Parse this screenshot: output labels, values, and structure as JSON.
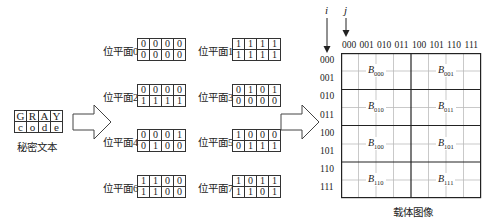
{
  "secret": {
    "rows": [
      [
        "G",
        "R",
        "A",
        "Y"
      ],
      [
        "c",
        "o",
        "d",
        "e"
      ]
    ],
    "caption": "秘密文本"
  },
  "bit_planes": [
    {
      "label": "位平面0",
      "rows": [
        [
          "0",
          "0",
          "0",
          "0"
        ],
        [
          "0",
          "0",
          "0",
          "0"
        ]
      ]
    },
    {
      "label": "位平面1",
      "rows": [
        [
          "1",
          "1",
          "1",
          "1"
        ],
        [
          "1",
          "1",
          "1",
          "1"
        ]
      ]
    },
    {
      "label": "位平面2",
      "rows": [
        [
          "0",
          "0",
          "0",
          "0"
        ],
        [
          "1",
          "1",
          "1",
          "1"
        ]
      ]
    },
    {
      "label": "位平面3",
      "rows": [
        [
          "0",
          "1",
          "0",
          "1"
        ],
        [
          "0",
          "0",
          "0",
          "0"
        ]
      ]
    },
    {
      "label": "位平面4",
      "rows": [
        [
          "0",
          "0",
          "0",
          "1"
        ],
        [
          "0",
          "1",
          "0",
          "0"
        ]
      ]
    },
    {
      "label": "位平面5",
      "rows": [
        [
          "1",
          "0",
          "0",
          "0"
        ],
        [
          "0",
          "1",
          "1",
          "1"
        ]
      ]
    },
    {
      "label": "位平面6",
      "rows": [
        [
          "1",
          "1",
          "0",
          "0"
        ],
        [
          "1",
          "1",
          "0",
          "0"
        ]
      ]
    },
    {
      "label": "位平面7",
      "rows": [
        [
          "1",
          "0",
          "1",
          "1"
        ],
        [
          "1",
          "1",
          "0",
          "1"
        ]
      ]
    }
  ],
  "carrier": {
    "i_label": "i",
    "j_label": "j",
    "col_labels": [
      "000",
      "001",
      "010",
      "011",
      "100",
      "101",
      "110",
      "111"
    ],
    "row_labels": [
      "000",
      "001",
      "010",
      "011",
      "100",
      "101",
      "110",
      "111"
    ],
    "blocks": [
      {
        "base": "B",
        "sub": "000"
      },
      {
        "base": "B",
        "sub": "001"
      },
      {
        "base": "B",
        "sub": "010"
      },
      {
        "base": "B",
        "sub": "011"
      },
      {
        "base": "B",
        "sub": "100"
      },
      {
        "base": "B",
        "sub": "101"
      },
      {
        "base": "B",
        "sub": "110"
      },
      {
        "base": "B",
        "sub": "111"
      }
    ],
    "caption": "载体图像"
  }
}
